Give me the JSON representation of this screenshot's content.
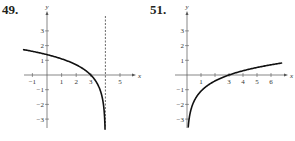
{
  "chart_data": [
    {
      "type": "line",
      "label": "49.",
      "title": "",
      "xlabel": "x",
      "ylabel": "y",
      "xlim": [
        -1.5,
        6
      ],
      "ylim": [
        -3.6,
        4
      ],
      "x_ticks": [
        -1,
        1,
        2,
        3,
        5
      ],
      "x_tick_labels": [
        "-1",
        "1",
        "2",
        "3",
        "5"
      ],
      "y_ticks": [
        -3,
        -2,
        -1,
        1,
        2,
        3
      ],
      "y_tick_labels": [
        "-3",
        "-2",
        "-1",
        "1",
        "2",
        "3"
      ],
      "asymptote": {
        "type": "vertical",
        "x": 4,
        "style": "dashed"
      },
      "grid": false,
      "series": [
        {
          "name": "curve",
          "function": "ln(4 - x)",
          "x": [
            -1.5,
            -1,
            0,
            1,
            2,
            3,
            3.5,
            3.9,
            3.97
          ],
          "y": [
            1.7,
            1.61,
            1.39,
            1.1,
            0.69,
            0,
            -0.69,
            -2.3,
            -3.5
          ]
        }
      ]
    },
    {
      "type": "line",
      "label": "51.",
      "title": "",
      "xlabel": "x",
      "ylabel": "y",
      "xlim": [
        -0.7,
        7
      ],
      "ylim": [
        -3.6,
        4
      ],
      "x_ticks": [
        1,
        2,
        3,
        4,
        5,
        6
      ],
      "x_tick_labels": [
        "1",
        "",
        "3",
        "4",
        "5",
        "6"
      ],
      "y_ticks": [
        -3,
        -2,
        -1,
        1,
        2,
        3
      ],
      "y_tick_labels": [
        "-3",
        "-2",
        "-1",
        "1",
        "2",
        "3"
      ],
      "grid": false,
      "series": [
        {
          "name": "curve",
          "function": "ln(x / 3)",
          "x": [
            0.09,
            0.2,
            0.5,
            1,
            2,
            3,
            4,
            5,
            6,
            6.7
          ],
          "y": [
            -3.5,
            -2.7,
            -1.79,
            -1.1,
            -0.41,
            0,
            0.29,
            0.51,
            0.69,
            0.8
          ]
        }
      ]
    }
  ]
}
